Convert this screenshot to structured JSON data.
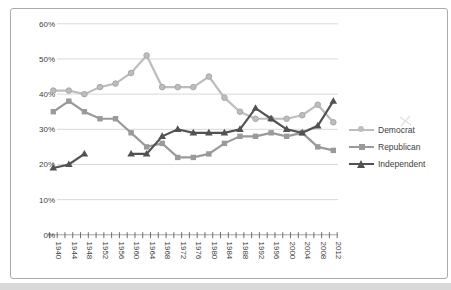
{
  "chart_data": {
    "type": "line",
    "title": "",
    "x": [
      1940,
      1944,
      1948,
      1952,
      1956,
      1960,
      1964,
      1968,
      1972,
      1976,
      1980,
      1984,
      1988,
      1992,
      1996,
      2000,
      2004,
      2008,
      2012
    ],
    "series": [
      {
        "name": "Democrat",
        "marker": "circle",
        "color": "#bdbdbd",
        "values": [
          41,
          41,
          40,
          42,
          43,
          46,
          51,
          42,
          42,
          42,
          45,
          39,
          35,
          33,
          33,
          33,
          34,
          37,
          32
        ]
      },
      {
        "name": "Republican",
        "marker": "square",
        "color": "#9a9a9a",
        "values": [
          35,
          38,
          35,
          33,
          33,
          29,
          25,
          26,
          22,
          22,
          23,
          26,
          28,
          28,
          29,
          28,
          29,
          25,
          24
        ]
      },
      {
        "name": "Independent",
        "marker": "triangle",
        "color": "#525252",
        "values": [
          19,
          20,
          23,
          null,
          null,
          23,
          23,
          28,
          30,
          29,
          29,
          29,
          30,
          36,
          33,
          30,
          29,
          31,
          38
        ]
      }
    ],
    "y_tick_labels": [
      "0%",
      "10%",
      "20%",
      "30%",
      "40%",
      "50%",
      "60%"
    ],
    "ylim": [
      0,
      60
    ],
    "grid": true,
    "legend_position": "right",
    "x_label_rotation_deg": 90
  },
  "legend": {
    "items": [
      {
        "label": "Democrat"
      },
      {
        "label": "Republican"
      },
      {
        "label": "Independent"
      }
    ]
  },
  "colors": {
    "gridline": "#d9d9d9",
    "axis": "#a6a6a6",
    "tick": "#6e6e6e",
    "label_text": "#404040",
    "frame_border": "#ababab",
    "bottom_strip": "#d9d9d9"
  }
}
